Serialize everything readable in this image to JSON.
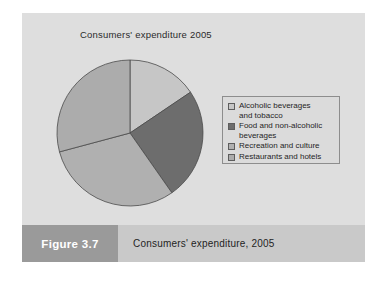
{
  "figure": {
    "number_label": "Figure 3.7",
    "caption": "Consumers' expenditure, 2005"
  },
  "chart_title": "Consumers' expenditure 2005",
  "legend": {
    "items": [
      {
        "label": "Alcoholic beverages\nand tobacco",
        "color": "#c6c6c6"
      },
      {
        "label": "Food and non-alcoholic\nbeverages",
        "color": "#6d6d6d"
      },
      {
        "label": "Recreation and culture",
        "color": "#b0b0b0"
      },
      {
        "label": "Restaurants and hotels",
        "color": "#acacac"
      }
    ]
  },
  "colors": {
    "panel": "#dcdcdc",
    "caption_bar": "#c9c9c9",
    "figure_number_box": "#9a9a9a",
    "slice_stroke": "#4a4a4a",
    "legend_border": "#8d8d8d"
  },
  "chart_data": {
    "type": "pie",
    "title": "Consumers' expenditure 2005",
    "legend_position": "right",
    "start_angle_deg": 0,
    "direction": "clockwise",
    "categories": [
      "Alcoholic beverages and tobacco",
      "Food and non-alcoholic beverages",
      "Recreation and culture",
      "Restaurants and hotels"
    ],
    "values": [
      15.6,
      24.7,
      30.6,
      29.1
    ],
    "value_unit": "percent",
    "angles_deg": [
      56,
      89,
      110,
      105
    ],
    "colors": [
      "#c6c6c6",
      "#6d6d6d",
      "#b0b0b0",
      "#acacac"
    ]
  }
}
